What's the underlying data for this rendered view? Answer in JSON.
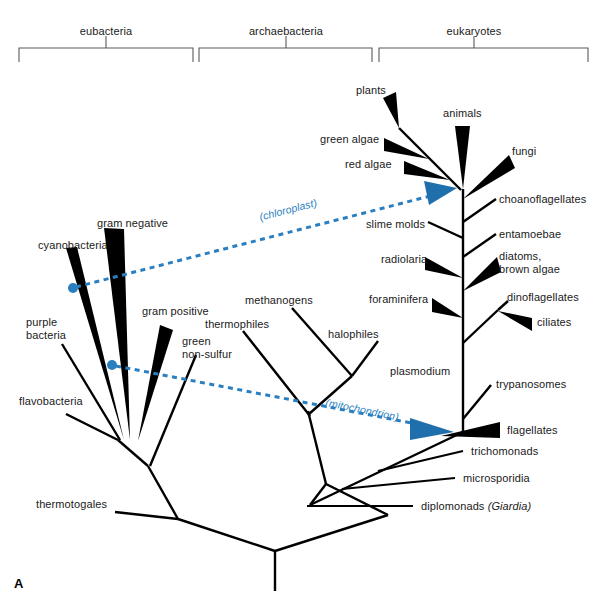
{
  "figure": {
    "panel_letter": "A",
    "width": 601,
    "height": 602,
    "background": "#ffffff",
    "line_color": "#000000",
    "transfer_color": "#2a7fc1",
    "bracket_color": "#555555"
  },
  "domains": [
    {
      "id": "eubacteria",
      "label": "eubacteria",
      "x": 106,
      "y": 33,
      "bracket": {
        "x1": 19,
        "x2": 193,
        "y": 48,
        "tick_x": 106
      }
    },
    {
      "id": "archaebacteria",
      "label": "archaebacteria",
      "x": 286,
      "y": 33,
      "bracket": {
        "x1": 199,
        "x2": 372,
        "y": 48,
        "tick_x": 286
      }
    },
    {
      "id": "eukaryotes",
      "label": "eukaryotes",
      "x": 474,
      "y": 33,
      "bracket": {
        "x1": 379,
        "x2": 588,
        "y": 48,
        "tick_x": 474
      }
    }
  ],
  "taxa": [
    {
      "id": "plants",
      "label": "plants",
      "x": 356,
      "y": 90,
      "align": "left",
      "domain": "eukaryotes"
    },
    {
      "id": "animals",
      "label": "animals",
      "x": 443,
      "y": 113,
      "align": "left",
      "domain": "eukaryotes"
    },
    {
      "id": "green-algae",
      "label": "green algae",
      "x": 320,
      "y": 139,
      "align": "left",
      "domain": "eukaryotes"
    },
    {
      "id": "fungi",
      "label": "fungi",
      "x": 512,
      "y": 151,
      "align": "left",
      "domain": "eukaryotes"
    },
    {
      "id": "red-algae",
      "label": "red algae",
      "x": 345,
      "y": 164,
      "align": "left",
      "domain": "eukaryotes"
    },
    {
      "id": "choanoflagellates",
      "label": "choanoflagellates",
      "x": 499,
      "y": 199,
      "align": "left",
      "domain": "eukaryotes"
    },
    {
      "id": "slime-molds",
      "label": "slime molds",
      "x": 366,
      "y": 224,
      "align": "left",
      "domain": "eukaryotes"
    },
    {
      "id": "entamoebae",
      "label": "entamoebae",
      "x": 499,
      "y": 234,
      "align": "left",
      "domain": "eukaryotes"
    },
    {
      "id": "radiolaria",
      "label": "radiolaria",
      "x": 381,
      "y": 259,
      "align": "left",
      "domain": "eukaryotes"
    },
    {
      "id": "diatoms",
      "label": "diatoms,\nbrown algae",
      "x": 499,
      "y": 256,
      "align": "left",
      "domain": "eukaryotes"
    },
    {
      "id": "foraminifera",
      "label": "foraminifera",
      "x": 369,
      "y": 299,
      "align": "left",
      "domain": "eukaryotes"
    },
    {
      "id": "dinoflagellates",
      "label": "dinoflagellates",
      "x": 507,
      "y": 297,
      "align": "left",
      "domain": "eukaryotes"
    },
    {
      "id": "ciliates",
      "label": "ciliates",
      "x": 537,
      "y": 322,
      "align": "left",
      "domain": "eukaryotes"
    },
    {
      "id": "plasmodium",
      "label": "plasmodium",
      "x": 390,
      "y": 371,
      "align": "left",
      "domain": "eukaryotes"
    },
    {
      "id": "trypanosomes",
      "label": "trypanosomes",
      "x": 496,
      "y": 384,
      "align": "left",
      "domain": "eukaryotes"
    },
    {
      "id": "flagellates",
      "label": "flagellates",
      "x": 507,
      "y": 430,
      "align": "left",
      "domain": "eukaryotes"
    },
    {
      "id": "trichomonads",
      "label": "trichomonads",
      "x": 471,
      "y": 451,
      "align": "left",
      "domain": "eukaryotes"
    },
    {
      "id": "microsporidia",
      "label": "microsporidia",
      "x": 463,
      "y": 478,
      "align": "left",
      "domain": "eukaryotes"
    },
    {
      "id": "diplomonads",
      "label": "diplomonads ",
      "label_italic": "(Giardia)",
      "x": 421,
      "y": 506,
      "align": "left",
      "domain": "eukaryotes"
    },
    {
      "id": "methanogens",
      "label": "methanogens",
      "x": 245,
      "y": 300,
      "align": "left",
      "domain": "archaebacteria"
    },
    {
      "id": "thermophiles",
      "label": "thermophiles",
      "x": 205,
      "y": 324,
      "align": "left",
      "domain": "archaebacteria"
    },
    {
      "id": "halophiles",
      "label": "halophiles",
      "x": 328,
      "y": 334,
      "align": "left",
      "domain": "archaebacteria"
    },
    {
      "id": "gram-negative",
      "label": "gram negative",
      "x": 97,
      "y": 223,
      "align": "left",
      "domain": "eubacteria"
    },
    {
      "id": "cyanobacteria",
      "label": "cyanobacteria",
      "x": 38,
      "y": 245,
      "align": "left",
      "domain": "eubacteria"
    },
    {
      "id": "gram-positive",
      "label": "gram positive",
      "x": 142,
      "y": 311,
      "align": "left",
      "domain": "eubacteria"
    },
    {
      "id": "purple-bacteria",
      "label": "purple\nbacteria",
      "x": 26,
      "y": 322,
      "align": "left",
      "domain": "eubacteria"
    },
    {
      "id": "green-non-sulfur",
      "label": "green\nnon-sulfur",
      "x": 182,
      "y": 341,
      "align": "left",
      "domain": "eubacteria"
    },
    {
      "id": "flavobacteria",
      "label": "flavobacteria",
      "x": 19,
      "y": 401,
      "align": "left",
      "domain": "eubacteria"
    },
    {
      "id": "thermotogales",
      "label": "thermotogales",
      "x": 36,
      "y": 504,
      "align": "left",
      "domain": "eubacteria"
    }
  ],
  "transfers": [
    {
      "id": "chloroplast",
      "label": "(chloroplast)",
      "label_x": 258,
      "label_y": 211,
      "label_rotate": -14.5,
      "from": {
        "x": 73,
        "y": 287
      },
      "to": {
        "x": 455,
        "y": 189
      },
      "color": "#2a7fc1",
      "origin_marker": "filled-dot",
      "target_marker": "arrowhead"
    },
    {
      "id": "mitochondrion",
      "label": "(mitochondrion)",
      "label_x": 327,
      "label_y": 404,
      "label_rotate": 11.5,
      "from": {
        "x": 112,
        "y": 365
      },
      "to": {
        "x": 452,
        "y": 431
      },
      "color": "#2a7fc1",
      "origin_marker": "filled-dot",
      "target_marker": "arrowhead"
    }
  ]
}
